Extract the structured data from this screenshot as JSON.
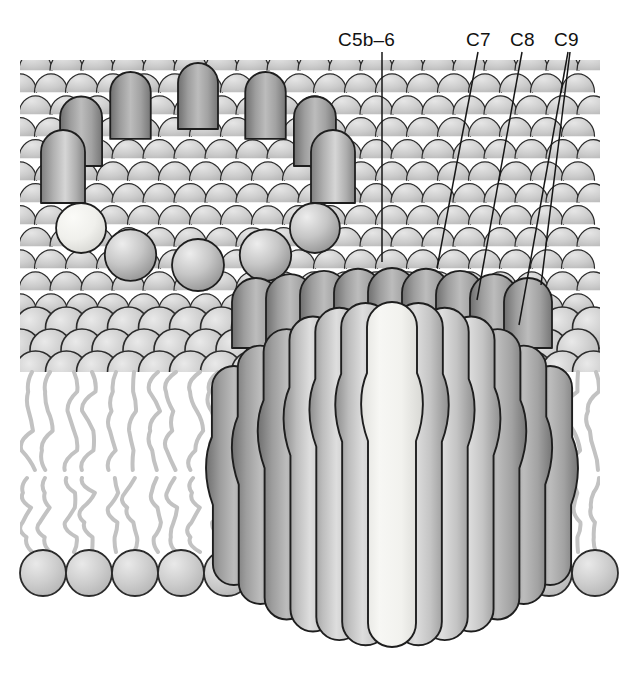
{
  "figure": {
    "width": 627,
    "height": 683,
    "background_color": "#ffffff"
  },
  "labels": [
    {
      "id": "c5b6",
      "text": "C5b–6",
      "x": 338,
      "y": 30,
      "leader": {
        "x1": 382,
        "y1": 52,
        "x2": 382,
        "y2": 262
      }
    },
    {
      "id": "c7",
      "text": "C7",
      "x": 466,
      "y": 30,
      "leader": {
        "x1": 478,
        "y1": 52,
        "x2": 437,
        "y2": 268
      }
    },
    {
      "id": "c8",
      "text": "C8",
      "x": 510,
      "y": 30,
      "leader": {
        "x1": 522,
        "y1": 52,
        "x2": 477,
        "y2": 300
      }
    },
    {
      "id": "c9",
      "text": "C9",
      "x": 554,
      "y": 30,
      "leader": {
        "x1": 568,
        "y1": 52,
        "x2": 519,
        "y2": 325
      },
      "leader2": {
        "x1": 570,
        "y1": 52,
        "x2": 541,
        "y2": 285
      }
    }
  ],
  "membrane": {
    "outer_leaflet": {
      "name": "outer-leaflet-lipid-heads",
      "top_y": 60,
      "bottom_y": 372,
      "scale_width": 31,
      "row_pitch": 22,
      "head_fill": "#c9c9c9",
      "head_stroke": "#2b2b2b",
      "full_sphere_rows": 2,
      "sphere_diameter": 42
    },
    "inner_leaflet": {
      "name": "inner-leaflet-lipid-heads",
      "center_y": 573,
      "sphere_diameter": 46,
      "head_fill": "#c9c9c9",
      "head_stroke": "#2b2b2b"
    },
    "tails": {
      "name": "acyl-chain-tails",
      "color": "#c2c2c2",
      "upper_top_y": 372,
      "upper_bottom_y": 470,
      "lower_top_y": 478,
      "lower_bottom_y": 552,
      "stroke_width": 4
    },
    "left_edge_x": 20,
    "right_edge_x": 600
  },
  "pore_front": {
    "name": "mac-pore-transmembrane",
    "center_x": 392,
    "top_y": 262,
    "bottom_y": 648,
    "radius_x": 170,
    "subunit_count": 13,
    "highlight_subunit_index": 6,
    "highlight_color": "#f6f6f4",
    "fill_light": "#e4e4e4",
    "fill_mid": "#b4b4b4",
    "fill_dark": "#8a8a8a",
    "stroke": "#1e1e1e"
  },
  "pore_back": {
    "name": "mac-ring-nascent",
    "center_x": 198,
    "center_y": 195,
    "radius_x": 135,
    "radius_y": 74,
    "subunit_count": 12,
    "highlight_subunit_index": 8,
    "highlight_color": "#f2f2ee",
    "fill_light": "#dcdcdc",
    "fill_mid": "#a8a8a8",
    "fill_dark": "#757575",
    "stroke": "#1e1e1e"
  },
  "colors": {
    "ink": "#111111",
    "leader_line": "#161616",
    "membrane_head": "#c9c9c9",
    "membrane_stroke": "#2b2b2b",
    "tail": "#c2c2c2",
    "protein_light": "#e4e4e4",
    "protein_dark": "#8a8a8a"
  }
}
